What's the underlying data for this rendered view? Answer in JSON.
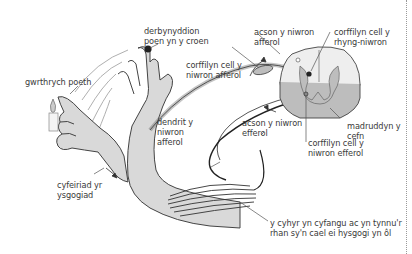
{
  "diagram": {
    "type": "reflex-arc",
    "labels": {
      "receptor": "derbynyddion\npoen yn y croen",
      "stimulus": "gwrthrych poeth",
      "afferent_cell_body": "corffilyn cell y\nniwron afferol",
      "afferent_axon": "acson y niwron\nafferol",
      "interneuron_cell_body": "corffilyn cell y\nrhyng-niwron",
      "afferent_dendrite": "dendrit y\nniwron\nafferol",
      "efferent_axon": "acson y niwron\nefferol",
      "spinal_cord": "madruddyn y\ncefn",
      "efferent_cell_body": "corffilyn cell y\nniwron efferol",
      "response_direction": "cyfeiriad yr\nysgogiad",
      "effector_muscle": "y cyhyr yn cyfangu ac yn tynnu'r\nrhan sy'n cael ei hysgogi yn ôl"
    },
    "colors": {
      "skin": "#d9d9d9",
      "outline": "#444444",
      "grey_matter": "#bdbdbd",
      "white_matter": "#eeeeee",
      "text": "#3a3a3a",
      "receptor_dot": "#222222"
    }
  }
}
